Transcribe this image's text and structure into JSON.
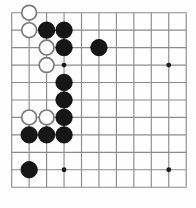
{
  "board": {
    "type": "go-board",
    "title": "Go board position diagram",
    "size_columns": 11,
    "size_rows": 11,
    "grid": {
      "origin_x": 11.7,
      "origin_y": 12.7,
      "spacing_x": 17.45,
      "spacing_y": 17.45,
      "line_color": "#8c8c8c",
      "background_color": "#fefefe"
    },
    "stone_radius": 8.2,
    "hoshi_radius": 2.4,
    "colors": {
      "black_stone": "#161616",
      "white_stone": "#ffffff",
      "white_stone_border": "#7a7a7a",
      "hoshi": "#1a1a1a"
    },
    "star_points": [
      {
        "col": 3,
        "row": 3
      },
      {
        "col": 9,
        "row": 3
      },
      {
        "col": 3,
        "row": 9
      },
      {
        "col": 9,
        "row": 9
      }
    ],
    "stones": [
      {
        "color": "white",
        "col": 1,
        "row": 0,
        "label": "white-stone-c1-r0"
      },
      {
        "color": "white",
        "col": 1,
        "row": 1,
        "label": "white-stone-c1-r1"
      },
      {
        "color": "black",
        "col": 2,
        "row": 1,
        "label": "black-stone-c2-r1"
      },
      {
        "color": "black",
        "col": 3,
        "row": 1,
        "label": "black-stone-c3-r1"
      },
      {
        "color": "white",
        "col": 2,
        "row": 2,
        "label": "white-stone-c2-r2"
      },
      {
        "color": "black",
        "col": 3,
        "row": 2,
        "label": "black-stone-c3-r2"
      },
      {
        "color": "black",
        "col": 5,
        "row": 2,
        "label": "black-stone-c5-r2"
      },
      {
        "color": "white",
        "col": 2,
        "row": 3,
        "label": "white-stone-c2-r3"
      },
      {
        "color": "black",
        "col": 3,
        "row": 4,
        "label": "black-stone-c3-r4"
      },
      {
        "color": "white",
        "col": 1,
        "row": 6,
        "label": "white-stone-c1-r6"
      },
      {
        "color": "white",
        "col": 2,
        "row": 6,
        "label": "white-stone-c2-r6"
      },
      {
        "color": "black",
        "col": 3,
        "row": 5,
        "label": "black-stone-c3-r5"
      },
      {
        "color": "black",
        "col": 3,
        "row": 6,
        "label": "black-stone-c3-r6"
      },
      {
        "color": "black",
        "col": 1,
        "row": 7,
        "label": "black-stone-c1-r7"
      },
      {
        "color": "black",
        "col": 2,
        "row": 7,
        "label": "black-stone-c2-r7"
      },
      {
        "color": "black",
        "col": 3,
        "row": 7,
        "label": "black-stone-c3-r7"
      },
      {
        "color": "black",
        "col": 1,
        "row": 9,
        "label": "black-stone-c1-r9"
      }
    ],
    "counts": {
      "black_stones": 11,
      "white_stones": 6,
      "total_stones": 17
    }
  }
}
